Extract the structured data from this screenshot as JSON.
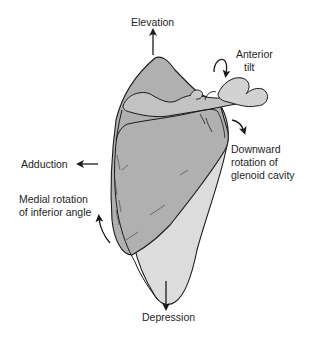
{
  "diagram": {
    "colors": {
      "bone_dark": "#a8a8a8",
      "bone_mid": "#bdbdbd",
      "bone_light": "#dcdcdc",
      "outline": "#1a1a1a",
      "text": "#1e1e1e",
      "background": "#ffffff"
    },
    "labels": {
      "elevation": "Elevation",
      "anterior_tilt_line1": "Anterior",
      "anterior_tilt_line2": "tilt",
      "downward_rotation_line1": "Downward",
      "downward_rotation_line2": "rotation of",
      "downward_rotation_line3": "glenoid cavity",
      "adduction": "Adduction",
      "medial_rotation_line1": "Medial rotation",
      "medial_rotation_line2": "of inferior angle",
      "depression": "Depression"
    },
    "arrows": [
      {
        "name": "elevation-arrow",
        "direction": "up"
      },
      {
        "name": "anterior-tilt-arrow",
        "direction": "curved-down"
      },
      {
        "name": "downward-rotation-arrow",
        "direction": "curved-down-right"
      },
      {
        "name": "adduction-arrow",
        "direction": "left"
      },
      {
        "name": "medial-rotation-arrow",
        "direction": "curved-up"
      },
      {
        "name": "depression-arrow",
        "direction": "down"
      }
    ]
  }
}
